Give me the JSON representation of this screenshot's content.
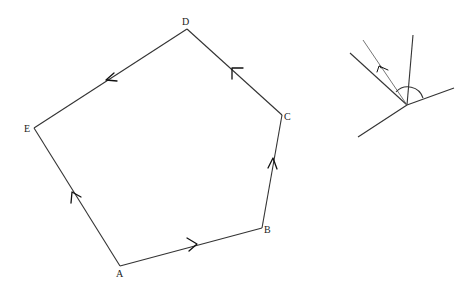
{
  "pentagon": {
    "vertices": [
      {
        "id": "A",
        "label": "A",
        "x": 120,
        "y": 266,
        "lx": 116,
        "ly": 277
      },
      {
        "id": "B",
        "label": "B",
        "x": 262,
        "y": 228,
        "lx": 264,
        "ly": 233
      },
      {
        "id": "C",
        "label": "C",
        "x": 282,
        "y": 115,
        "lx": 284,
        "ly": 120
      },
      {
        "id": "D",
        "label": "D",
        "x": 187,
        "y": 29,
        "lx": 182,
        "ly": 25
      },
      {
        "id": "E",
        "label": "E",
        "x": 34,
        "y": 128,
        "lx": 24,
        "ly": 132
      }
    ],
    "edges": [
      {
        "from": "A",
        "to": "B",
        "direction": "A-to-B"
      },
      {
        "from": "B",
        "to": "C",
        "direction": "B-to-C"
      },
      {
        "from": "C",
        "to": "D",
        "direction": "C-to-D"
      },
      {
        "from": "D",
        "to": "E",
        "direction": "D-to-E"
      },
      {
        "from": "E",
        "to": "A",
        "direction": "A-to-E"
      }
    ]
  },
  "angle_diagram": {
    "vertex": {
      "x": 407,
      "y": 105
    },
    "rays": [
      {
        "name": "upper-left-ray",
        "x": 367,
        "y": 54
      },
      {
        "name": "vertical-ray",
        "x": 413,
        "y": 36
      },
      {
        "name": "right-ray",
        "x": 454,
        "y": 88
      },
      {
        "name": "lower-left-ray",
        "x": 360,
        "y": 137
      }
    ],
    "arrow_vector": {
      "x": 383,
      "y": 40
    },
    "arc_radius": 16
  },
  "colors": {
    "background": "#ffffff",
    "line": "#333333",
    "arrow": "#111111",
    "thin_line": "#666666"
  }
}
